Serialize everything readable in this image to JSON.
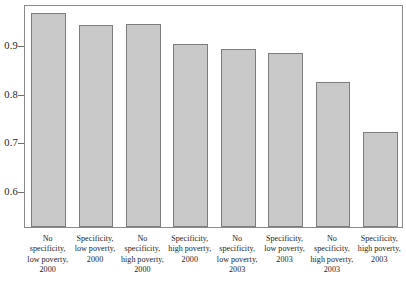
{
  "chart_data": {
    "type": "bar",
    "title": "",
    "subtitle": "",
    "xlabel": "",
    "ylabel": "",
    "ylim": [
      0.525,
      0.985
    ],
    "grid": false,
    "legend": null,
    "bar_color": "#c9c9c9",
    "bar_edge_color": "#7d7d7d",
    "frame_color": "#8a8a8a",
    "y_ticks": [
      0.6,
      0.7,
      0.8,
      0.9
    ],
    "y_tick_labels": [
      "0.6",
      "0.7",
      "0.8",
      "0.9"
    ],
    "categories": [
      "No specificity, low poverty, 2000",
      "Specificity, low poverty, 2000",
      "No specificity, high poverty, 2000",
      "Specificity, high poverty, 2000",
      "No specificity, low poverty, 2003",
      "Specificity, low poverty, 2003",
      "No specificity, high poverty, 2003",
      "Specificity, high poverty, 2003"
    ],
    "category_lines": [
      [
        "No",
        "specificity,",
        "low poverty,",
        "2000"
      ],
      [
        "Specificity,",
        "low poverty,",
        "2000"
      ],
      [
        "No",
        "specificity,",
        "high poverty,",
        "2000"
      ],
      [
        "Specificity,",
        "high poverty,",
        "2000"
      ],
      [
        "No",
        "specificity,",
        "low poverty,",
        "2003"
      ],
      [
        "Specificity,",
        "low poverty,",
        "2003"
      ],
      [
        "No",
        "specificity,",
        "high poverty,",
        "2003"
      ],
      [
        "Specificity,",
        "high poverty,",
        "2003"
      ]
    ],
    "values": [
      0.967,
      0.942,
      0.944,
      0.902,
      0.892,
      0.883,
      0.825,
      0.721
    ]
  }
}
